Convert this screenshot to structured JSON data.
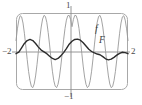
{
  "figure": {
    "kind": "function-plot",
    "background_color": "#ffffff",
    "frame": {
      "name": "plot-frame",
      "shape": "rounded-rectangle",
      "stroke_color": "#a8a8a8",
      "corner_radius": 6,
      "x": 16,
      "y": 13,
      "width": 112,
      "height": 77
    },
    "axes": {
      "x_axis_color": "#8a8a8a",
      "y_axis_color": "#8a8a8a",
      "x_axis_y_px": 52,
      "y_axis_x_px": 71
    }
  },
  "labels": {
    "x_min": "−2",
    "x_max": "2",
    "y_max": "1",
    "y_min": "−1",
    "curve_f": "f",
    "curve_F": "F"
  },
  "chart_data": {
    "type": "line",
    "title": "",
    "xlabel": "",
    "ylabel": "",
    "xlim": [
      -2,
      2
    ],
    "ylim": [
      -1,
      1
    ],
    "grid": false,
    "legend": "inline-curve-labels",
    "xticks": [
      -2,
      2
    ],
    "xticklabels": [
      "−2",
      "2"
    ],
    "yticks": [
      -1,
      1
    ],
    "yticklabels": [
      "−1",
      "1"
    ],
    "series": [
      {
        "name": "f",
        "label": "f",
        "color": "#999999",
        "linewidth": 0.9,
        "description": "high-frequency oscillation, large amplitude, roughly cos(12x)-like envelope riding near full scale",
        "x": [
          -2.0,
          -1.95,
          -1.9,
          -1.85,
          -1.8,
          -1.75,
          -1.7,
          -1.65,
          -1.6,
          -1.55,
          -1.5,
          -1.45,
          -1.4,
          -1.35,
          -1.3,
          -1.25,
          -1.2,
          -1.15,
          -1.1,
          -1.05,
          -1.0,
          -0.95,
          -0.9,
          -0.85,
          -0.8,
          -0.75,
          -0.7,
          -0.65,
          -0.6,
          -0.55,
          -0.5,
          -0.45,
          -0.4,
          -0.35,
          -0.3,
          -0.25,
          -0.2,
          -0.15,
          -0.1,
          -0.05,
          0.0,
          0.05,
          0.1,
          0.15,
          0.2,
          0.25,
          0.3,
          0.35,
          0.4,
          0.45,
          0.5,
          0.55,
          0.6,
          0.65,
          0.7,
          0.75,
          0.8,
          0.85,
          0.9,
          0.95,
          1.0,
          1.05,
          1.1,
          1.15,
          1.2,
          1.25,
          1.3,
          1.35,
          1.4,
          1.45,
          1.5,
          1.55,
          1.6,
          1.65,
          1.7,
          1.75,
          1.8,
          1.85,
          1.9,
          1.95,
          2.0
        ],
        "y": [
          0.3,
          0.62,
          0.86,
          0.98,
          0.95,
          0.78,
          0.5,
          0.15,
          -0.22,
          -0.55,
          -0.8,
          -0.96,
          -0.99,
          -0.89,
          -0.67,
          -0.36,
          0.0,
          0.36,
          0.67,
          0.89,
          0.99,
          0.96,
          0.8,
          0.52,
          0.18,
          -0.2,
          -0.54,
          -0.8,
          -0.95,
          -0.99,
          -0.9,
          -0.7,
          -0.4,
          -0.05,
          0.32,
          0.63,
          0.86,
          0.98,
          0.99,
          0.88,
          0.68,
          0.88,
          0.99,
          0.98,
          0.86,
          0.63,
          0.32,
          -0.05,
          -0.4,
          -0.7,
          -0.9,
          -0.99,
          -0.95,
          -0.8,
          -0.54,
          -0.2,
          0.18,
          0.52,
          0.8,
          0.96,
          0.99,
          0.89,
          0.67,
          0.36,
          0.0,
          -0.36,
          -0.67,
          -0.89,
          -0.99,
          -0.96,
          -0.8,
          -0.55,
          -0.22,
          0.15,
          0.5,
          0.78,
          0.95,
          0.98,
          0.86,
          0.62,
          0.3
        ]
      },
      {
        "name": "F",
        "label": "F",
        "color": "#2b2b2b",
        "linewidth": 1.4,
        "description": "slow small-amplitude antiderivative-like wave oscillating about zero, peaks near x=-1.4 and x=0.35, troughs near x=-0.6 and x=1.3",
        "x": [
          -2.0,
          -1.9,
          -1.8,
          -1.7,
          -1.6,
          -1.5,
          -1.4,
          -1.3,
          -1.2,
          -1.1,
          -1.0,
          -0.9,
          -0.8,
          -0.7,
          -0.6,
          -0.5,
          -0.4,
          -0.3,
          -0.2,
          -0.1,
          0.0,
          0.1,
          0.2,
          0.3,
          0.4,
          0.5,
          0.6,
          0.7,
          0.8,
          0.9,
          1.0,
          1.1,
          1.2,
          1.3,
          1.4,
          1.5,
          1.6,
          1.7,
          1.8,
          1.9,
          2.0
        ],
        "y": [
          -0.06,
          -0.02,
          0.1,
          0.22,
          0.3,
          0.33,
          0.3,
          0.22,
          0.12,
          0.04,
          -0.01,
          -0.06,
          -0.13,
          -0.19,
          -0.22,
          -0.19,
          -0.12,
          -0.03,
          0.08,
          0.2,
          0.28,
          0.33,
          0.34,
          0.31,
          0.24,
          0.15,
          0.06,
          0.0,
          -0.04,
          -0.07,
          -0.09,
          -0.14,
          -0.2,
          -0.23,
          -0.21,
          -0.16,
          -0.1,
          -0.05,
          -0.02,
          -0.03,
          -0.06
        ]
      }
    ]
  }
}
